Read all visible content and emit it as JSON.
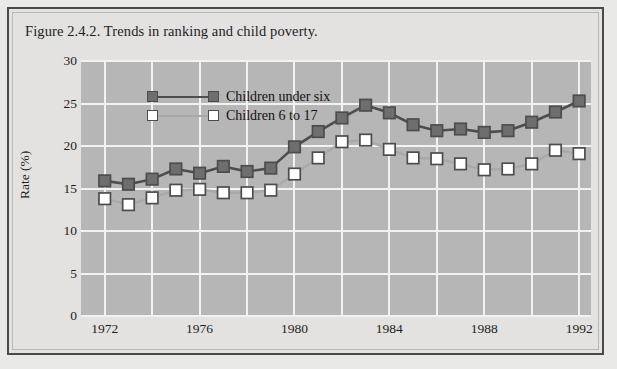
{
  "figure": {
    "title": "Figure 2.4.2. Trends in ranking and child poverty."
  },
  "colors": {
    "plot_background": "#b6b6b6",
    "figure_background": "#e3e2e0",
    "gridline": "#f2f2f2",
    "series_under_six": "#6e6e6e",
    "series_6_to_17": "#d8d8d8",
    "line_under_six": "#4d4d4d",
    "line_6_to_17": "#a9a9a9",
    "text": "#1d1d1d",
    "border": "#4a4a4a"
  },
  "chart_data": {
    "type": "line",
    "title": "Figure 2.4.2. Trends in ranking and child poverty.",
    "xlabel": "",
    "ylabel": "Rate (%)",
    "xlim": [
      1971,
      1992.5
    ],
    "ylim": [
      0,
      30
    ],
    "ytick_labels": [
      "0",
      "5",
      "10",
      "15",
      "20",
      "25",
      "30"
    ],
    "ytick_values": [
      0,
      5,
      10,
      15,
      20,
      25,
      30
    ],
    "xtick_labels": [
      "1972",
      "1976",
      "1980",
      "1984",
      "1988",
      "1992"
    ],
    "xtick_values": [
      1972,
      1976,
      1980,
      1984,
      1988,
      1992
    ],
    "xgrid_values": [
      1972,
      1974,
      1976,
      1978,
      1980,
      1982,
      1984,
      1986,
      1988,
      1990,
      1992
    ],
    "grid": true,
    "legend_position": "upper left",
    "x": [
      1972,
      1973,
      1974,
      1975,
      1976,
      1977,
      1978,
      1979,
      1980,
      1981,
      1982,
      1983,
      1984,
      1985,
      1986,
      1987,
      1988,
      1989,
      1990,
      1991,
      1992
    ],
    "series": [
      {
        "name": "Children under six",
        "marker": "filled-square",
        "values": [
          15.9,
          15.5,
          16.1,
          17.3,
          16.8,
          17.6,
          17.0,
          17.4,
          19.9,
          21.7,
          23.3,
          24.8,
          23.9,
          22.5,
          21.8,
          22.0,
          21.6,
          21.8,
          22.8,
          24.0,
          25.3
        ]
      },
      {
        "name": "Children 6 to 17",
        "marker": "open-square",
        "values": [
          13.8,
          13.1,
          13.9,
          14.8,
          14.9,
          14.5,
          14.5,
          14.8,
          16.7,
          18.6,
          20.5,
          20.7,
          19.6,
          18.6,
          18.5,
          17.9,
          17.2,
          17.3,
          17.9,
          19.5,
          19.1
        ]
      }
    ]
  },
  "legend": {
    "items": [
      {
        "label": "Children under six"
      },
      {
        "label": "Children 6 to 17"
      }
    ]
  }
}
